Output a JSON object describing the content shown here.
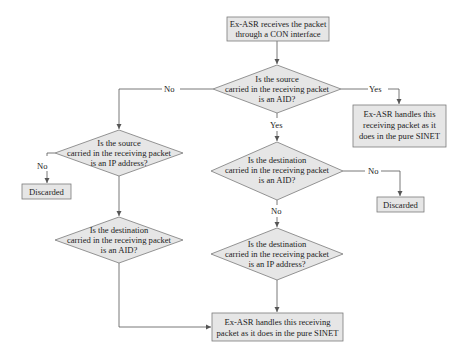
{
  "diagram": {
    "type": "flowchart",
    "nodes": {
      "start": {
        "lines": [
          "Ex-ASR receives the packet",
          "through a CON interface"
        ]
      },
      "q_source_aid": {
        "lines": [
          "Is the source",
          "carried in the receiving packet",
          "is an AID?"
        ]
      },
      "handle_pure_sinet_right": {
        "lines": [
          "Ex-ASR handles this",
          "receiving packet as it",
          "does in the pure SINET"
        ]
      },
      "q_source_ip": {
        "lines": [
          "Is the source",
          "carried in the receiving packet",
          "is an IP address?"
        ]
      },
      "discarded_left": {
        "lines": [
          "Discarded"
        ]
      },
      "q_dest_aid_mid": {
        "lines": [
          "Is the destination",
          "carried in the receiving packet",
          "is an AID?"
        ]
      },
      "discarded_right": {
        "lines": [
          "Discarded"
        ]
      },
      "q_dest_aid_left": {
        "lines": [
          "Is the destination",
          "carried in the receiving packet",
          "is an AID?"
        ]
      },
      "q_dest_ip": {
        "lines": [
          "Is the destination",
          "carried in the receiving packet",
          "is an IP address?"
        ]
      },
      "handle_pure_sinet_bottom": {
        "lines": [
          "Ex-ASR handles this receiving",
          "packet as it does in the pure SINET"
        ]
      }
    },
    "edge_labels": {
      "source_aid_no": "No",
      "source_aid_yes_right": "Yes",
      "source_aid_yes_down": "Yes",
      "source_ip_no": "No",
      "dest_aid_mid_no_right": "No",
      "dest_aid_mid_no_down": "No"
    },
    "colors": {
      "box_fill": "#e6e6e6",
      "box_stroke": "#7a7a7a",
      "line": "#555555",
      "text": "#222222"
    }
  }
}
